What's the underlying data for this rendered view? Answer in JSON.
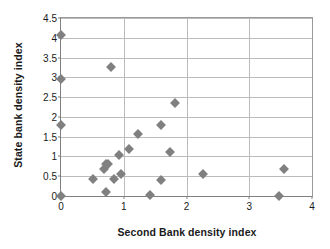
{
  "chart_data": {
    "type": "scatter",
    "title": "",
    "xlabel": "Second Bank density index",
    "ylabel": "State bank density index",
    "xlim": [
      0,
      4
    ],
    "ylim": [
      0,
      4.5
    ],
    "xticks": [
      "0",
      "1",
      "2",
      "3",
      "4"
    ],
    "xtick_values": [
      0,
      1,
      2,
      3,
      4
    ],
    "yticks": [
      "0",
      "0.5",
      "1",
      "1.5",
      "2",
      "2.5",
      "3",
      "3.5",
      "4",
      "4.5"
    ],
    "ytick_values": [
      0,
      0.5,
      1,
      1.5,
      2,
      2.5,
      3,
      3.5,
      4,
      4.5
    ],
    "grid": "horizontal-and-vertical",
    "legend": "none",
    "marker": "diamond",
    "marker_color": "#808080",
    "points": [
      {
        "x": 0.0,
        "y": 4.08
      },
      {
        "x": 0.0,
        "y": 2.97
      },
      {
        "x": 0.0,
        "y": 1.79
      },
      {
        "x": 0.0,
        "y": 0.0
      },
      {
        "x": 0.79,
        "y": 3.26
      },
      {
        "x": 1.82,
        "y": 2.34
      },
      {
        "x": 1.6,
        "y": 1.79
      },
      {
        "x": 1.22,
        "y": 1.57
      },
      {
        "x": 1.73,
        "y": 1.12
      },
      {
        "x": 1.08,
        "y": 1.19
      },
      {
        "x": 0.93,
        "y": 1.03
      },
      {
        "x": 0.72,
        "y": 0.82
      },
      {
        "x": 0.75,
        "y": 0.8
      },
      {
        "x": 0.69,
        "y": 0.69
      },
      {
        "x": 3.56,
        "y": 0.67
      },
      {
        "x": 2.27,
        "y": 0.56
      },
      {
        "x": 0.95,
        "y": 0.55
      },
      {
        "x": 0.51,
        "y": 0.44
      },
      {
        "x": 0.85,
        "y": 0.44
      },
      {
        "x": 1.59,
        "y": 0.4
      },
      {
        "x": 0.71,
        "y": 0.09
      },
      {
        "x": 1.42,
        "y": 0.03
      },
      {
        "x": 3.48,
        "y": 0.0
      }
    ]
  }
}
